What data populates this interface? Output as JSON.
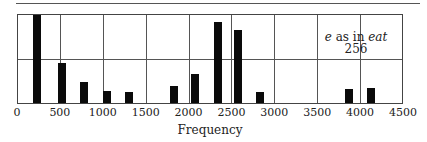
{
  "chart_data": {
    "type": "bar",
    "title": "",
    "xlabel": "Frequency",
    "ylabel": "",
    "xlim": [
      0,
      4500
    ],
    "ylim": [
      0,
      1.0
    ],
    "grid": true,
    "x_ticks": [
      0,
      500,
      1000,
      1500,
      2000,
      2500,
      3000,
      3500,
      4000,
      4500
    ],
    "annotation": {
      "vowel": "e",
      "text_mid": " as in ",
      "word": "eat",
      "number": "256"
    },
    "x": [
      230,
      530,
      780,
      1050,
      1300,
      1830,
      2070,
      2340,
      2580,
      2830,
      3870,
      4130
    ],
    "values": [
      1.0,
      0.46,
      0.24,
      0.14,
      0.12,
      0.19,
      0.33,
      0.92,
      0.83,
      0.13,
      0.16,
      0.17
    ],
    "colors": {
      "bar": "#0a0a0a",
      "grid": "#555555"
    }
  },
  "labels": {
    "ticks": [
      "0",
      "500",
      "1000",
      "1500",
      "2000",
      "2500",
      "3000",
      "3500",
      "4000",
      "4500"
    ],
    "xlabel": "Frequency"
  }
}
